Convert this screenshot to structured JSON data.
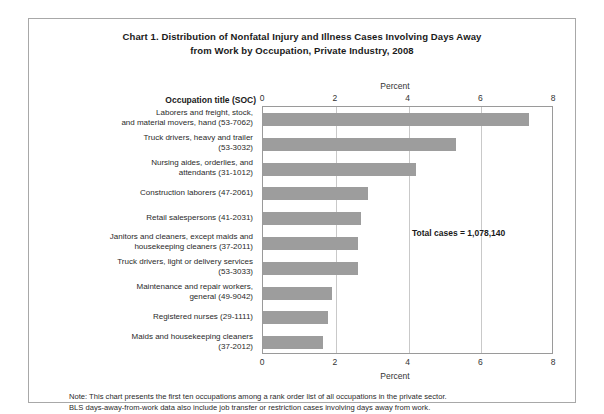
{
  "chart_card": {
    "title_line1": "Chart 1. Distribution of Nonfatal Injury and Illness Cases Involving Days Away",
    "title_line2": "from Work by Occupation, Private Industry, 2008",
    "occupation_header": "Occupation title (SOC)",
    "annotation": "Total cases = 1,078,140",
    "footnote_line1": "Note: This chart presents the first ten occupations among a rank order list of all occupations in the private sector.",
    "footnote_line2": "BLS days-away-from-work data also include job transfer or restriction cases involving days away from work.",
    "bar_color": "#9d9d9d",
    "frame_color": "#a8a8a8",
    "gridline_color": "#c9c9c9"
  },
  "chart_data": {
    "type": "bar",
    "orientation": "horizontal",
    "title": "Chart 1. Distribution of Nonfatal Injury and Illness Cases Involving Days Away from Work by Occupation, Private Industry, 2008",
    "xlabel": "Percent",
    "ylabel": "Occupation title (SOC)",
    "xlim": [
      0,
      8
    ],
    "xticks": [
      0,
      2,
      4,
      6,
      8
    ],
    "xtick_labels": [
      "0",
      "2",
      "4",
      "6",
      "8"
    ],
    "grid": true,
    "legend": false,
    "annotations": [
      "Total cases = 1,078,140"
    ],
    "categories": [
      "Laborers and freight, stock, and material movers, hand (53-7062)",
      "Truck drivers, heavy and trailer (53-3032)",
      "Nursing aides, orderlies, and attendants (31-1012)",
      "Construction laborers (47-2061)",
      "Retail salespersons (41-2031)",
      "Janitors and cleaners, except maids and housekeeping cleaners (37-2011)",
      "Truck drivers, light or delivery services (53-3033)",
      "Maintenance and repair workers, general (49-9042)",
      "Registered nurses (29-1111)",
      "Maids and housekeeping cleaners (37-2012)"
    ],
    "category_lines": [
      [
        "Laborers and freight, stock,",
        "and material movers, hand (53-7062)"
      ],
      [
        "Truck drivers, heavy and trailer",
        "(53-3032)"
      ],
      [
        "Nursing aides, orderlies, and",
        "attendants (31-1012)"
      ],
      [
        "Construction laborers (47-2061)"
      ],
      [
        "Retail salespersons (41-2031)"
      ],
      [
        "Janitors and cleaners, except maids and",
        "housekeeping cleaners (37-2011)"
      ],
      [
        "Truck drivers, light or delivery services",
        "(53-3033)"
      ],
      [
        "Maintenance and repair workers,",
        "general (49-9042)"
      ],
      [
        "Registered nurses (29-1111)"
      ],
      [
        "Maids and housekeeping cleaners",
        "(37-2012)"
      ]
    ],
    "values": [
      7.3,
      5.3,
      4.2,
      2.9,
      2.7,
      2.6,
      2.6,
      1.9,
      1.8,
      1.65
    ]
  }
}
